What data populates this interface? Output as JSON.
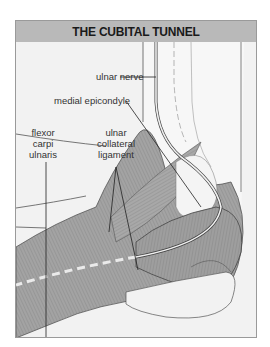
{
  "figure": {
    "title": "THE CUBITAL TUNNEL",
    "colors": {
      "header_bg": "#b9b9b9",
      "panel_bg": "#f2f2f2",
      "muscle": "#9c9c9c",
      "outline": "#555555",
      "nerve_dash": "#e8e8e8"
    },
    "labels": {
      "ulnar_nerve": "ulnar nerve",
      "medial_epicondyle": "medial epicondyle",
      "flexor_carpi_ulnaris": [
        "flexor",
        "carpi",
        "ulnaris"
      ],
      "ulnar_collateral_ligament": [
        "ulnar",
        "collateral",
        "ligament"
      ]
    }
  }
}
